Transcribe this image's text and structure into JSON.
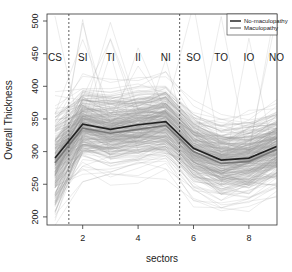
{
  "chart_data": {
    "type": "line",
    "title": "",
    "xlabel": "sectors",
    "ylabel": "Overall Thickness",
    "x": [
      1,
      2,
      3,
      4,
      5,
      6,
      7,
      8,
      9
    ],
    "xlim": [
      0.75,
      9.25
    ],
    "ylim": [
      190,
      510
    ],
    "x_ticks": [
      2,
      4,
      6,
      8
    ],
    "y_ticks": [
      200,
      250,
      300,
      350,
      400,
      450,
      500
    ],
    "sector_labels": [
      "CS",
      "SI",
      "TI",
      "II",
      "NI",
      "SO",
      "TO",
      "IO",
      "NO"
    ],
    "sector_label_y": 445,
    "dashed_vlines": [
      1.5,
      5.5
    ],
    "grid": false,
    "legend_position": "top-right",
    "legend": [
      {
        "name": "No-maculopathy",
        "color": "#333333",
        "width": 1.6
      },
      {
        "name": "Maculopathy",
        "color": "#888888",
        "width": 1.6
      }
    ],
    "series": [
      {
        "name": "No-maculopathy (mean)",
        "color": "#222222",
        "values": [
          290,
          342,
          334,
          341,
          346,
          305,
          287,
          290,
          308
        ]
      },
      {
        "name": "Maculopathy (mean)",
        "color": "#777777",
        "values": [
          283,
          336,
          328,
          334,
          340,
          300,
          282,
          285,
          303
        ]
      }
    ],
    "individual_profiles": {
      "count_approx": 300,
      "color": "#9a9a9a",
      "center_values": [
        285,
        340,
        332,
        338,
        344,
        302,
        284,
        288,
        306
      ],
      "spread_sd": 28,
      "description": "Many thin grey individual eye profiles across the 9 sectors, concentrated around the means, with a few outliers reaching 450-510"
    }
  }
}
